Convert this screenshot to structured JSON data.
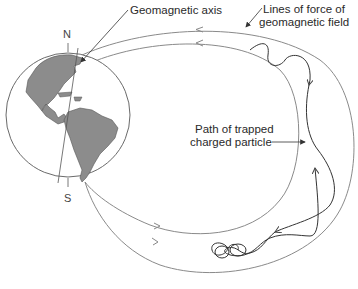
{
  "figure": {
    "labels": {
      "geomagnetic_axis": "Geomagnetic axis",
      "lines_of_force_1": "Lines of force of",
      "lines_of_force_2": "geomagnetic field",
      "path_1": "Path of trapped",
      "path_2": "charged particle",
      "north": "N",
      "south": "S"
    },
    "colors": {
      "land": "#8c8c8c",
      "line": "#7a7a7a",
      "particle": "#3a3a3a",
      "text": "#2a2a2a"
    }
  }
}
